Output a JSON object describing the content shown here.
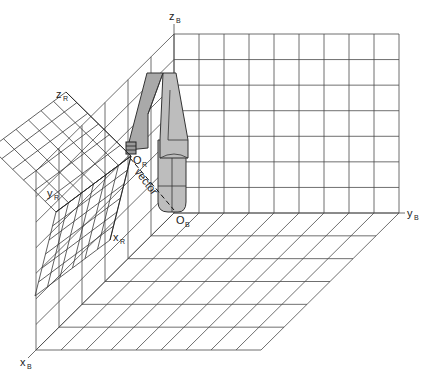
{
  "figure": {
    "type": "3d-coordinate-frames-diagram"
  },
  "base_frame": {
    "axes": [
      {
        "id": "xB",
        "label": "x",
        "subscript": "B"
      },
      {
        "id": "yB",
        "label": "y",
        "subscript": "B"
      },
      {
        "id": "zB",
        "label": "z",
        "subscript": "B"
      }
    ],
    "origin": {
      "label": "O",
      "subscript": "B"
    },
    "grid_cells": {
      "y": 9,
      "z": 7,
      "x": 6
    }
  },
  "robot_frame": {
    "axes": [
      {
        "id": "xR",
        "label": "x",
        "subscript": "R"
      },
      {
        "id": "yR",
        "label": "y",
        "subscript": "R"
      },
      {
        "id": "zR",
        "label": "z",
        "subscript": "R"
      }
    ],
    "origin": {
      "label": "O",
      "subscript": "R"
    },
    "grid_cells": 6
  },
  "vector": {
    "label": "vector"
  },
  "colors": {
    "line": "#4a4a4a",
    "arm_fill": "#bdbdbd",
    "arm_shadow": "#a9a9a9",
    "background": "#ffffff"
  }
}
